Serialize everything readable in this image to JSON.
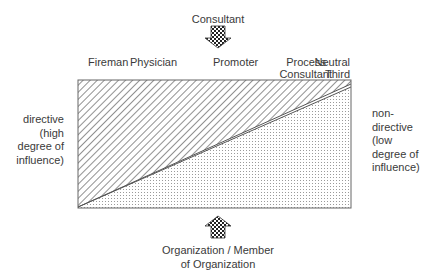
{
  "top_arrow": {
    "label": "Consultant",
    "direction": "down"
  },
  "bottom_arrow": {
    "label_line1": "Organization / Member",
    "label_line2": "of Organization",
    "direction": "up"
  },
  "roles": [
    {
      "line1": "Fireman",
      "line2": ""
    },
    {
      "line1": "Physician",
      "line2": ""
    },
    {
      "line1": "Promoter",
      "line2": ""
    },
    {
      "line1": "Process",
      "line2": "Consultant"
    },
    {
      "line1": "Neutral",
      "line2": "Third"
    }
  ],
  "left_label": {
    "lines": [
      "directive",
      "(high",
      "degree of",
      "influence)"
    ]
  },
  "right_label": {
    "lines": [
      "non-",
      "directive",
      "(low",
      "degree of",
      "influence)"
    ]
  },
  "regions": {
    "upper": {
      "fill": "diagonal-hatch",
      "meaning": "consultant influence"
    },
    "lower": {
      "fill": "dotted",
      "meaning": "organization influence"
    }
  },
  "colors": {
    "line": "#555555",
    "text": "#3a3a3a"
  }
}
